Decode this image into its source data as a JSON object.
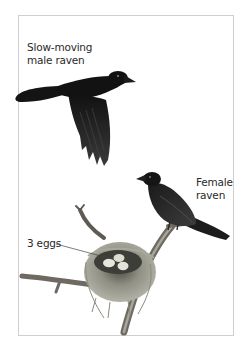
{
  "illustration": {
    "subject": "Raven pair with nest",
    "labels": {
      "male": {
        "line1": "Slow-moving",
        "line2": "male raven"
      },
      "female": {
        "line1": "Female",
        "line2": "raven"
      },
      "eggs": {
        "text": "3 eggs"
      }
    },
    "egg_count": 3,
    "colors": {
      "border": "#cfcfcf",
      "text": "#2a2a2a",
      "raven": "#141414",
      "nest": "#8a8a7e",
      "branch": "#6e6a62",
      "egg": "#e8e6dc"
    }
  }
}
